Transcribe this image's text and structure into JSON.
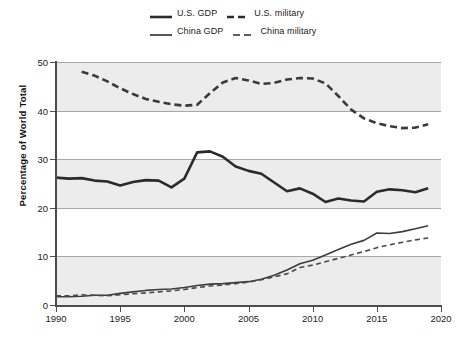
{
  "chart_data": {
    "type": "line",
    "title": "",
    "subtitle": "",
    "xlabel": "",
    "ylabel": "Percentage of World Total",
    "xlim": [
      1990,
      2020
    ],
    "ylim": [
      0,
      50
    ],
    "xticks": [
      1990,
      1995,
      2000,
      2005,
      2010,
      2015,
      2020
    ],
    "yticks": [
      0,
      10,
      20,
      30,
      40,
      50
    ],
    "xtick_labels": [
      "1990",
      "1995",
      "2000",
      "2005",
      "2010",
      "2015",
      "2020"
    ],
    "ytick_labels": [
      "0",
      "10",
      "20",
      "30",
      "40",
      "50"
    ],
    "grid": true,
    "grid_bands": true,
    "legend_position": "top-center",
    "series": [
      {
        "name": "U.S. GDP",
        "style": "solid",
        "width": "thick",
        "color": "#2b2b2b",
        "x": [
          1990,
          1991,
          1992,
          1993,
          1994,
          1995,
          1996,
          1997,
          1998,
          1999,
          2000,
          2001,
          2002,
          2003,
          2004,
          2005,
          2006,
          2007,
          2008,
          2009,
          2010,
          2011,
          2012,
          2013,
          2014,
          2015,
          2016,
          2017,
          2018,
          2019
        ],
        "values": [
          26.2,
          26.0,
          26.1,
          25.6,
          25.4,
          24.6,
          25.3,
          25.7,
          25.6,
          24.2,
          26.0,
          31.4,
          31.6,
          30.5,
          28.5,
          27.6,
          27.0,
          25.2,
          23.4,
          24.0,
          22.9,
          21.2,
          21.9,
          21.5,
          21.3,
          23.3,
          23.8,
          23.6,
          23.2,
          24.0
        ]
      },
      {
        "name": "U.S. military",
        "style": "dashed",
        "width": "thick",
        "color": "#3a3a3a",
        "x": [
          1992,
          1993,
          1994,
          1995,
          1996,
          1997,
          1998,
          1999,
          2000,
          2001,
          2002,
          2003,
          2004,
          2005,
          2006,
          2007,
          2008,
          2009,
          2010,
          2011,
          2012,
          2013,
          2014,
          2015,
          2016,
          2017,
          2018,
          2019
        ],
        "values": [
          48.0,
          47.2,
          46.0,
          44.6,
          43.4,
          42.4,
          41.8,
          41.3,
          41.0,
          41.2,
          43.6,
          45.8,
          46.7,
          46.2,
          45.5,
          45.7,
          46.4,
          46.7,
          46.6,
          45.6,
          43.0,
          40.2,
          38.4,
          37.4,
          36.8,
          36.4,
          36.5,
          37.2
        ]
      },
      {
        "name": "China GDP",
        "style": "solid",
        "width": "thin",
        "color": "#3d3d3d",
        "x": [
          1990,
          1991,
          1992,
          1993,
          1994,
          1995,
          1996,
          1997,
          1998,
          1999,
          2000,
          2001,
          2002,
          2003,
          2004,
          2005,
          2006,
          2007,
          2008,
          2009,
          2010,
          2011,
          2012,
          2013,
          2014,
          2015,
          2016,
          2017,
          2018,
          2019
        ],
        "values": [
          1.7,
          1.7,
          1.8,
          2.0,
          2.0,
          2.4,
          2.7,
          3.0,
          3.2,
          3.3,
          3.6,
          4.0,
          4.3,
          4.4,
          4.6,
          4.8,
          5.3,
          6.1,
          7.2,
          8.5,
          9.2,
          10.3,
          11.4,
          12.5,
          13.3,
          14.8,
          14.7,
          15.1,
          15.7,
          16.3
        ]
      },
      {
        "name": "China military",
        "style": "dashed",
        "width": "thin",
        "color": "#4a4a4a",
        "x": [
          1990,
          1991,
          1992,
          1993,
          1994,
          1995,
          1996,
          1997,
          1998,
          1999,
          2000,
          2001,
          2002,
          2003,
          2004,
          2005,
          2006,
          2007,
          2008,
          2009,
          2010,
          2011,
          2012,
          2013,
          2014,
          2015,
          2016,
          2017,
          2018,
          2019
        ],
        "values": [
          1.9,
          1.9,
          2.1,
          2.0,
          1.9,
          2.1,
          2.3,
          2.5,
          2.7,
          2.9,
          3.2,
          3.6,
          3.9,
          4.1,
          4.4,
          4.7,
          5.2,
          5.8,
          6.4,
          7.7,
          8.2,
          8.9,
          9.6,
          10.3,
          11.0,
          11.8,
          12.4,
          12.9,
          13.4,
          13.8
        ]
      }
    ]
  },
  "legend": {
    "entries": [
      {
        "label": "U.S. GDP",
        "style": "solid",
        "width": "thick"
      },
      {
        "label": "U.S. military",
        "style": "dashed",
        "width": "thick"
      },
      {
        "label": "China GDP",
        "style": "solid",
        "width": "thin"
      },
      {
        "label": "China military",
        "style": "dashed",
        "width": "thin"
      }
    ]
  }
}
